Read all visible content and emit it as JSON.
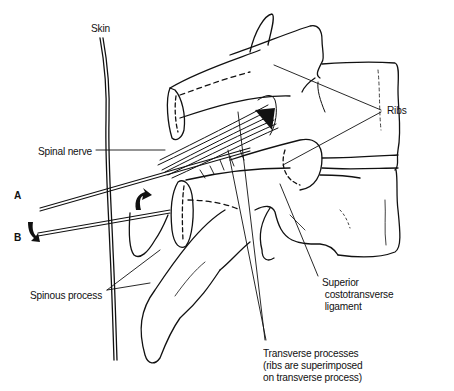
{
  "figure": {
    "type": "anatomical line illustration",
    "line_color": "#111111",
    "background": "#ffffff"
  },
  "labels": {
    "skin": "Skin",
    "ribs": "Ribs",
    "spinal_nerve": "Spinal nerve",
    "needle_a": "A",
    "needle_b": "B",
    "spinous_process": "Spinous process",
    "superior_costotransverse_ligament": {
      "line1": "Superior",
      "line2": "costotransverse",
      "line3": "ligament"
    },
    "transverse_processes": {
      "line1": "Transverse processes",
      "line2": "(ribs are superimposed",
      "line3": "on transverse process)"
    }
  },
  "arrows": [
    {
      "name": "arrow-up-curved",
      "near": "needle A",
      "direction": "up"
    },
    {
      "name": "arrow-down-curved",
      "near": "needle B",
      "direction": "down"
    }
  ]
}
